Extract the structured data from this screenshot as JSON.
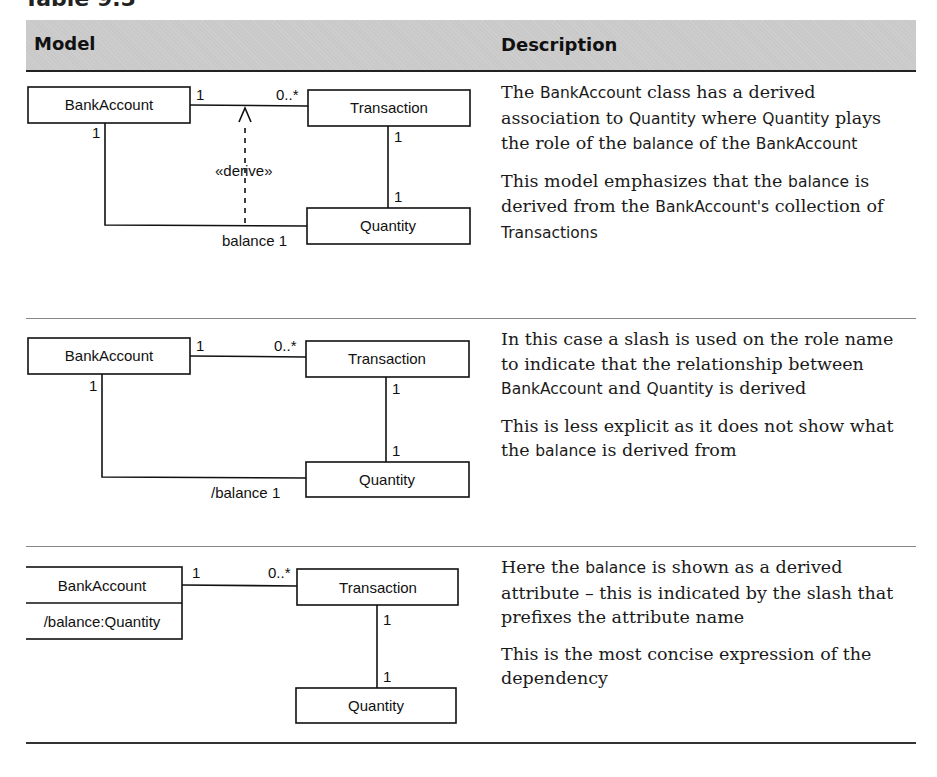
{
  "title": "Table 9.5",
  "header": {
    "model": "Model",
    "description": "Description"
  },
  "rows": [
    {
      "diagram": {
        "classes": {
          "bank": "BankAccount",
          "transaction": "Transaction",
          "quantity": "Quantity"
        },
        "multiplicities": {
          "bank_tx": "1",
          "tx_bank": "0..*",
          "bank_down": "1",
          "tx_down": "1",
          "qty_up": "1"
        },
        "role": "balance 1",
        "stereotype": "«derive»"
      },
      "paragraphs": [
        [
          {
            "t": "The ",
            "code": false
          },
          {
            "t": "BankAccount",
            "code": true
          },
          {
            "t": " class has a derived association to ",
            "code": false
          },
          {
            "t": "Quantity",
            "code": true
          },
          {
            "t": " where ",
            "code": false
          },
          {
            "t": "Quantity",
            "code": true
          },
          {
            "t": " plays the role of the ",
            "code": false
          },
          {
            "t": "balance",
            "code": true
          },
          {
            "t": " of the ",
            "code": false
          },
          {
            "t": "BankAccount",
            "code": true
          }
        ],
        [
          {
            "t": "This model emphasizes that the ",
            "code": false
          },
          {
            "t": "balance",
            "code": true
          },
          {
            "t": " is derived from the ",
            "code": false
          },
          {
            "t": "BankAccount's",
            "code": true
          },
          {
            "t": " collection of ",
            "code": false
          },
          {
            "t": "Transactions",
            "code": true
          }
        ]
      ]
    },
    {
      "diagram": {
        "classes": {
          "bank": "BankAccount",
          "transaction": "Transaction",
          "quantity": "Quantity"
        },
        "multiplicities": {
          "bank_tx": "1",
          "tx_bank": "0..*",
          "bank_down": "1",
          "tx_down": "1",
          "qty_up": "1"
        },
        "role": "/balance 1"
      },
      "paragraphs": [
        [
          {
            "t": "In this case a slash is used on the role name to indicate that the relationship between ",
            "code": false
          },
          {
            "t": "BankAccount",
            "code": true
          },
          {
            "t": " and ",
            "code": false
          },
          {
            "t": "Quantity",
            "code": true
          },
          {
            "t": " is derived",
            "code": false
          }
        ],
        [
          {
            "t": "This is less explicit as it does not show what the ",
            "code": false
          },
          {
            "t": "balance",
            "code": true
          },
          {
            "t": " is derived from",
            "code": false
          }
        ]
      ]
    },
    {
      "diagram": {
        "classes": {
          "bank": "BankAccount",
          "bank_attr": "/balance:Quantity",
          "transaction": "Transaction",
          "quantity": "Quantity"
        },
        "multiplicities": {
          "bank_tx": "1",
          "tx_bank": "0..*",
          "tx_down": "1",
          "qty_up": "1"
        }
      },
      "paragraphs": [
        [
          {
            "t": "Here the ",
            "code": false
          },
          {
            "t": "balance",
            "code": true
          },
          {
            "t": " is shown as a derived attribute – this is indicated by the slash that prefixes the attribute name",
            "code": false
          }
        ],
        [
          {
            "t": "This is the most concise expression of the dependency",
            "code": false
          }
        ]
      ]
    }
  ]
}
